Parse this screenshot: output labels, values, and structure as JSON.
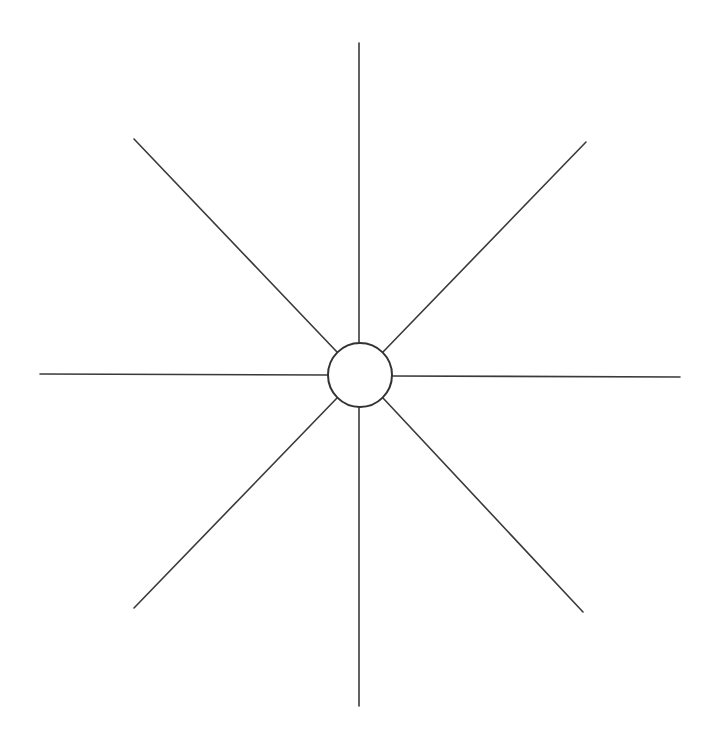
{
  "diagram": {
    "type": "radial-spoke",
    "background": "#ffffff",
    "line_color": "#3a3a3a",
    "line_width": 1.6,
    "hub": {
      "cx": 360,
      "cy": 375,
      "r": 32,
      "stroke": "#333333",
      "stroke_width": 2,
      "fill": "#ffffff"
    },
    "spokes": [
      {
        "name": "spoke-north",
        "x1": 359,
        "y1": 43,
        "x2": 359,
        "y2": 343
      },
      {
        "name": "spoke-northeast",
        "x1": 383,
        "y1": 352,
        "x2": 586,
        "y2": 142
      },
      {
        "name": "spoke-east",
        "x1": 392,
        "y1": 376,
        "x2": 680,
        "y2": 377
      },
      {
        "name": "spoke-southeast",
        "x1": 383,
        "y1": 398,
        "x2": 583,
        "y2": 612
      },
      {
        "name": "spoke-south",
        "x1": 359,
        "y1": 407,
        "x2": 359,
        "y2": 706
      },
      {
        "name": "spoke-southwest",
        "x1": 337,
        "y1": 398,
        "x2": 134,
        "y2": 608
      },
      {
        "name": "spoke-west",
        "x1": 40,
        "y1": 374,
        "x2": 328,
        "y2": 375
      },
      {
        "name": "spoke-northwest",
        "x1": 134,
        "y1": 139,
        "x2": 337,
        "y2": 352
      }
    ]
  }
}
